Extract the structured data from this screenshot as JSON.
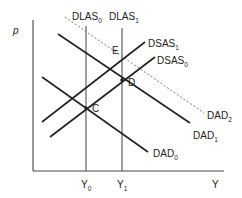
{
  "diagram": {
    "axes": {
      "y_label": "p",
      "x_label": "Y",
      "x_ticks": [
        {
          "main": "Y",
          "sub": "0"
        },
        {
          "main": "Y",
          "sub": "1"
        }
      ]
    },
    "curves": {
      "dlas0": {
        "main": "DLAS",
        "sub": "0"
      },
      "dlas1": {
        "main": "DLAS",
        "sub": "1"
      },
      "dsas1": {
        "main": "DSAS",
        "sub": "1"
      },
      "dsas0": {
        "main": "DSAS",
        "sub": "0"
      },
      "dad2": {
        "main": "DAD",
        "sub": "2"
      },
      "dad1": {
        "main": "DAD",
        "sub": "1"
      },
      "dad0": {
        "main": "DAD",
        "sub": "0"
      }
    },
    "points": {
      "c": "C",
      "d": "D",
      "e": "E"
    },
    "colors": {
      "line": "#222222",
      "axis": "#444444",
      "dashed": "#777777"
    }
  }
}
